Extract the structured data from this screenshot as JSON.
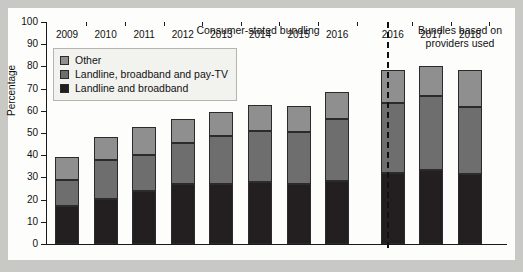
{
  "chart_data": {
    "type": "bar",
    "subtype": "stacked",
    "title": "",
    "xlabel": "",
    "ylabel": "Percentage",
    "ylim": [
      0,
      100
    ],
    "yticks": [
      0,
      10,
      20,
      30,
      40,
      50,
      60,
      70,
      80,
      90,
      100
    ],
    "grid": false,
    "legend_position": "upper left",
    "panel_titles": {
      "left": "Consumer-stated bundling",
      "right_line1": "Bundles based on",
      "right_line2": "providers used"
    },
    "divider": "dashed vertical line between 2016 (consumer-stated) and 2016 (providers used)",
    "categories": [
      "2009",
      "2010",
      "2011",
      "2012",
      "2013",
      "2014",
      "2015",
      "2016",
      "2016",
      "2017",
      "2018"
    ],
    "groups": [
      {
        "name": "Consumer-stated bundling",
        "categories": [
          "2009",
          "2010",
          "2011",
          "2012",
          "2013",
          "2014",
          "2015",
          "2016"
        ]
      },
      {
        "name": "Bundles based on providers used",
        "categories": [
          "2016",
          "2017",
          "2018"
        ]
      }
    ],
    "series": [
      {
        "name": "Landline and broadband",
        "color": "#231f20",
        "values": [
          17,
          20.5,
          24,
          27,
          27,
          28,
          27,
          28.5,
          32,
          33.5,
          31.5
        ]
      },
      {
        "name": "Landline, broadband and pay-TV",
        "color": "#6e6e6e",
        "values": [
          12,
          17.5,
          16,
          18.5,
          21.5,
          23,
          23.5,
          28,
          31.5,
          33,
          30
        ]
      },
      {
        "name": "Other",
        "color": "#8f8f8f",
        "values": [
          10,
          10,
          12.5,
          11,
          11,
          11.5,
          11.5,
          12,
          15,
          13.5,
          17
        ]
      }
    ],
    "totals": [
      39,
      48,
      52.5,
      56.5,
      59.5,
      62.5,
      62,
      68.5,
      78.5,
      80,
      78.5
    ],
    "cumulative_boundaries": {
      "bottom_top": [
        17,
        20.5,
        24,
        27,
        27,
        28,
        27,
        28.5,
        32,
        33.5,
        31.5
      ],
      "mid_top": [
        29,
        38,
        40,
        45.5,
        48.5,
        51,
        50.5,
        56.5,
        63.5,
        66.5,
        61.5
      ]
    }
  },
  "legend": {
    "items": [
      {
        "label": "Other",
        "color": "#8f8f8f"
      },
      {
        "label": "Landline, broadband and pay-TV",
        "color": "#6e6e6e"
      },
      {
        "label": "Landline and broadband",
        "color": "#231f20"
      }
    ]
  }
}
